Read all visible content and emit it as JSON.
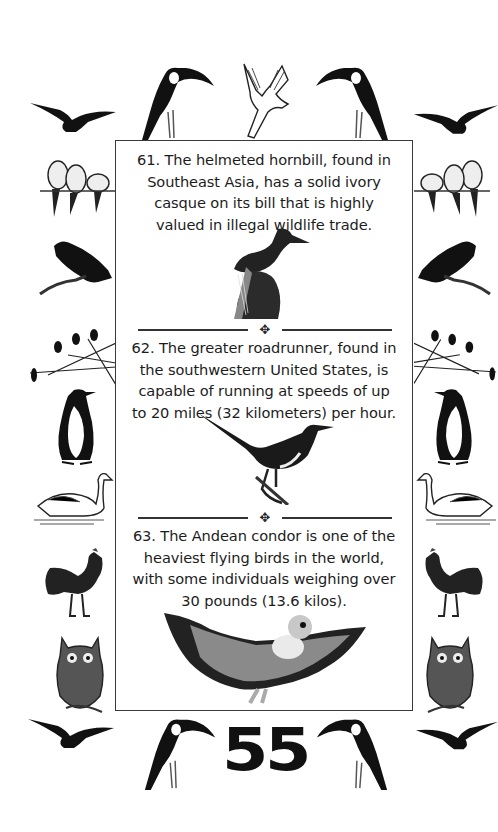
{
  "page": {
    "page_number": "55",
    "facts": [
      {
        "number": "61",
        "text": "61. The helmeted hornbill, found in Southeast Asia, has a solid ivory casque on its bill that is highly valued in illegal wildlife trade.",
        "lines": [
          "61. The helmeted hornbill, found in",
          "Southeast Asia, has a solid ivory",
          "casque on its bill that is highly",
          "valued in illegal wildlife trade."
        ],
        "illustration": "helmeted-hornbill"
      },
      {
        "number": "62",
        "text": "62. The greater roadrunner, found in the southwestern United States, is capable of running at speeds of up to 20 miles (32 kilometers) per hour.",
        "lines": [
          "62. The greater roadrunner, found in",
          "the southwestern United States, is",
          "capable of running at speeds of up",
          "to 20 miles (32 kilometers) per hour."
        ],
        "illustration": "greater-roadrunner"
      },
      {
        "number": "63",
        "text": "63. The Andean condor is one of the heaviest flying birds in the world, with some individuals weighing over 30 pounds (13.6 kilos).",
        "lines": [
          "63. The Andean condor is one of the",
          "heaviest flying birds in the world,",
          "with some individuals weighing over",
          "30 pounds (13.6 kilos)."
        ],
        "illustration": "andean-condor"
      }
    ],
    "divider_ornament": "✥",
    "border_birds": {
      "top": [
        "flying-bird",
        "toucan",
        "cockatoo",
        "toucan",
        "flying-bird"
      ],
      "left": [
        "lovebirds",
        "hawk",
        "birds-on-branch",
        "penguin",
        "swan",
        "rooster",
        "owl"
      ],
      "right": [
        "lovebirds",
        "hawk",
        "birds-on-branch",
        "penguin",
        "swan",
        "rooster",
        "owl"
      ],
      "bottom": [
        "flying-bird",
        "toucan",
        "toucan",
        "flying-bird"
      ]
    }
  }
}
